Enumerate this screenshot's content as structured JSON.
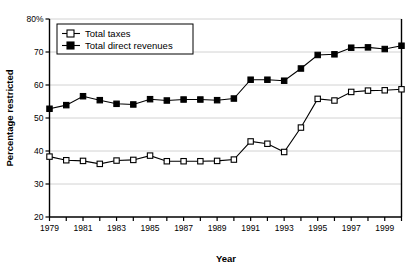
{
  "chart_data": {
    "type": "line",
    "title": "",
    "xlabel": "Year",
    "ylabel": "Percentage restricted",
    "xlim": [
      1979,
      2000
    ],
    "ylim": [
      20,
      80
    ],
    "ytick_values": [
      20,
      30,
      40,
      50,
      60,
      70,
      80
    ],
    "ytick_labels": [
      "20",
      "30",
      "40",
      "50",
      "60",
      "70",
      "80%"
    ],
    "xtick_values": [
      1979,
      1980,
      1981,
      1982,
      1983,
      1984,
      1985,
      1986,
      1987,
      1988,
      1989,
      1990,
      1991,
      1992,
      1993,
      1994,
      1995,
      1996,
      1997,
      1998,
      1999,
      2000
    ],
    "xtick_labels": [
      "1979",
      "",
      "1981",
      "",
      "1983",
      "",
      "1985",
      "",
      "1987",
      "",
      "1989",
      "",
      "1991",
      "",
      "1993",
      "",
      "1995",
      "",
      "1997",
      "",
      "1999",
      ""
    ],
    "grid": "horizontal",
    "legend_position": "top-left",
    "x": [
      1979,
      1980,
      1981,
      1982,
      1983,
      1984,
      1985,
      1986,
      1987,
      1988,
      1989,
      1990,
      1991,
      1992,
      1993,
      1994,
      1995,
      1996,
      1997,
      1998,
      1999,
      2000
    ],
    "series": [
      {
        "name": "Total taxes",
        "marker": "open-square",
        "color": "#000000",
        "values": [
          38.3,
          37.2,
          37.0,
          36.1,
          37.1,
          37.3,
          38.6,
          36.9,
          36.9,
          36.9,
          37.0,
          37.4,
          42.9,
          42.2,
          39.7,
          47.1,
          55.8,
          55.3,
          57.9,
          58.3,
          58.4,
          58.7
        ]
      },
      {
        "name": "Total direct revenues",
        "marker": "filled-square",
        "color": "#000000",
        "values": [
          52.8,
          53.9,
          56.6,
          55.4,
          54.3,
          54.1,
          55.7,
          55.3,
          55.6,
          55.6,
          55.4,
          55.9,
          61.6,
          61.6,
          61.3,
          65.0,
          69.1,
          69.3,
          71.3,
          71.4,
          70.9,
          71.9
        ]
      }
    ]
  },
  "legend": {
    "items": [
      {
        "label": "Total taxes"
      },
      {
        "label": "Total direct revenues"
      }
    ]
  },
  "axes": {
    "y_title": "Percentage restricted",
    "x_title": "Year"
  }
}
